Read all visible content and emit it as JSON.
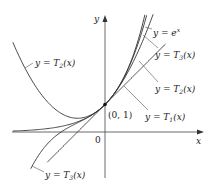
{
  "figure": {
    "axes": {
      "x_label": "x",
      "y_label": "y",
      "origin_label": "0"
    },
    "point_label": "(0, 1)",
    "labels": {
      "exp": {
        "prefix": "y = e",
        "sup": "x"
      },
      "t3_upper": {
        "prefix": "y = T",
        "sub": "3",
        "suffix": "(x)"
      },
      "t2_right": {
        "prefix": "y = T",
        "sub": "2",
        "suffix": "(x)"
      },
      "t1": {
        "prefix": "y = T",
        "sub": "1",
        "suffix": "(x)"
      },
      "t2_left": {
        "prefix": "y = T",
        "sub": "2",
        "suffix": "(x)"
      },
      "t3_lower": {
        "prefix": "y = T",
        "sub": "3",
        "suffix": "(x)"
      }
    }
  },
  "chart_data": {
    "type": "line",
    "title": "",
    "xlabel": "x",
    "ylabel": "y",
    "grid": false,
    "xlim": [
      -3.4,
      3.6
    ],
    "ylim": [
      -1.7,
      4.3
    ],
    "annotations": [
      "(0, 1)",
      "0"
    ],
    "series": [
      {
        "name": "y = e^x",
        "function": "e^x"
      },
      {
        "name": "y = T1(x)",
        "function": "1 + x"
      },
      {
        "name": "y = T2(x)",
        "function": "1 + x + x^2/2"
      },
      {
        "name": "y = T3(x)",
        "function": "1 + x + x^2/2 + x^3/6"
      }
    ],
    "point": {
      "x": 0,
      "y": 1,
      "label": "(0, 1)"
    }
  }
}
